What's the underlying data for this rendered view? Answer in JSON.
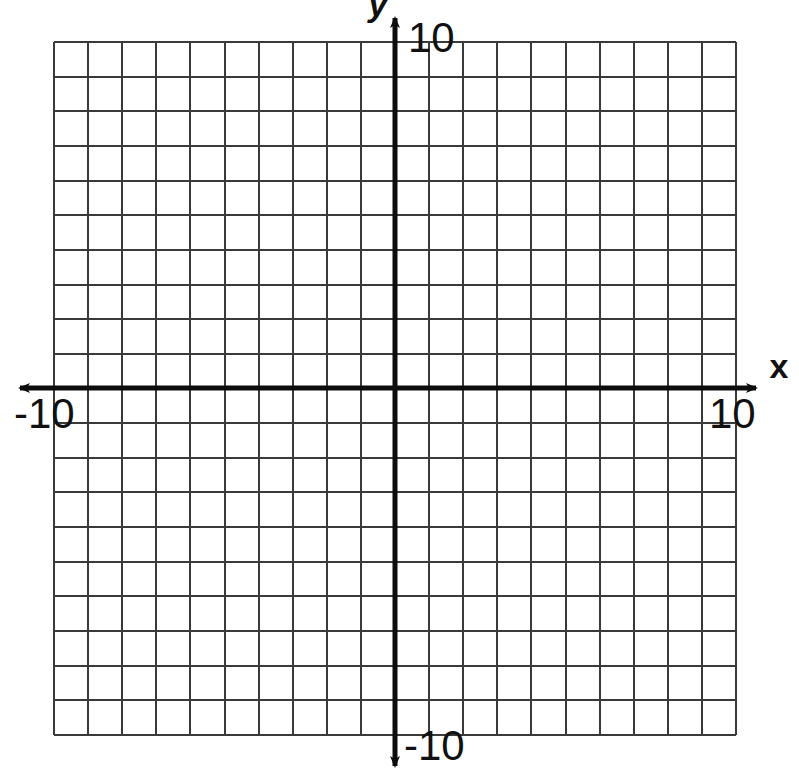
{
  "page": {
    "width": 799,
    "height": 781,
    "background_color": "#ffffff"
  },
  "labels": {
    "y_axis_name": "y",
    "x_axis_name": "x",
    "y_max": "10",
    "y_min": "-10",
    "x_max": "10",
    "x_min": "-10"
  },
  "chart_data": {
    "type": "scatter",
    "title": "",
    "subtitle": "",
    "xlabel": "x",
    "ylabel": "y",
    "xlim": [
      -10,
      10
    ],
    "ylim": [
      -10,
      10
    ],
    "xticks": [
      -10,
      10
    ],
    "yticks": [
      -10,
      10
    ],
    "xtick_labels": [
      "-10",
      "10"
    ],
    "ytick_labels": [
      "-10",
      "10"
    ],
    "grid": true,
    "grid_step": 1,
    "grid_columns": 20,
    "grid_rows": 20,
    "legend": null,
    "legend_position": "none",
    "series": [],
    "annotations": [],
    "colors": {
      "grid_line": "#3a3a3a",
      "axis_line": "#0d0d0d",
      "text": "#111111",
      "background": "#ffffff"
    },
    "axis_arrows": [
      "left",
      "right",
      "up",
      "down"
    ]
  }
}
